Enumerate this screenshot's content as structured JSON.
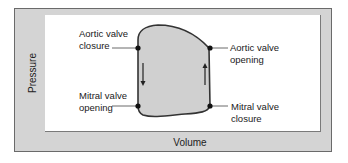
{
  "diagram": {
    "type": "pressure-volume loop",
    "axes": {
      "y_label": "Pressure",
      "x_label": "Volume"
    },
    "annotations": [
      {
        "id": "aortic-valve-closure",
        "line1": "Aortic valve",
        "line2": "closure",
        "position": "top-left"
      },
      {
        "id": "aortic-valve-opening",
        "line1": "Aortic valve",
        "line2": "opening",
        "position": "top-right"
      },
      {
        "id": "mitral-valve-opening",
        "line1": "Mitral valve",
        "line2": "opening",
        "position": "bottom-left"
      },
      {
        "id": "mitral-valve-closure",
        "line1": "Mitral valve",
        "line2": "closure",
        "position": "bottom-right"
      }
    ],
    "arrows": [
      {
        "side": "left",
        "direction": "down"
      },
      {
        "side": "right",
        "direction": "up"
      }
    ],
    "colors": {
      "frame": "#d4d4d4",
      "loop_fill": "#d0d0d0",
      "loop_stroke": "#333333",
      "plot_bg": "#ffffff"
    }
  }
}
